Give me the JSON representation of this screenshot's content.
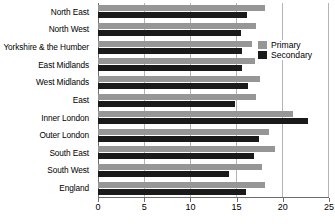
{
  "chart_data": {
    "type": "bar",
    "orientation": "horizontal",
    "title": "",
    "xlabel": "",
    "ylabel": "",
    "xlim": [
      0,
      25
    ],
    "xticks": [
      0,
      5,
      10,
      15,
      20,
      25
    ],
    "xtick_labels": [
      "0",
      "5",
      "10",
      "15",
      "20",
      "25"
    ],
    "grid": true,
    "grid_axis": "x",
    "legend_position": "upper right inside",
    "categories": [
      "North East",
      "North West",
      "Yorkshire & the Humber",
      "East Midlands",
      "West Midlands",
      "East",
      "Inner London",
      "Outer London",
      "South East",
      "South West",
      "England"
    ],
    "series": [
      {
        "name": "Primary",
        "color": "#969696",
        "values": [
          18.1,
          17.2,
          16.7,
          17.1,
          17.6,
          17.2,
          21.2,
          18.6,
          19.2,
          17.8,
          18.1
        ]
      },
      {
        "name": "Secondary",
        "color": "#1a1a1a",
        "values": [
          16.2,
          15.5,
          15.7,
          15.7,
          16.3,
          14.9,
          22.8,
          17.5,
          17.0,
          14.2,
          16.1
        ]
      }
    ]
  },
  "legend": {
    "entries": [
      {
        "label": "Primary",
        "swatch": "primary-swatch"
      },
      {
        "label": "Secondary",
        "swatch": "secondary-swatch"
      }
    ]
  },
  "colors": {
    "primary": "#969696",
    "secondary": "#1a1a1a",
    "gridline": "#b4b4b4",
    "axis": "#6e6e6e",
    "background": "#ffffff",
    "text": "#000000"
  }
}
